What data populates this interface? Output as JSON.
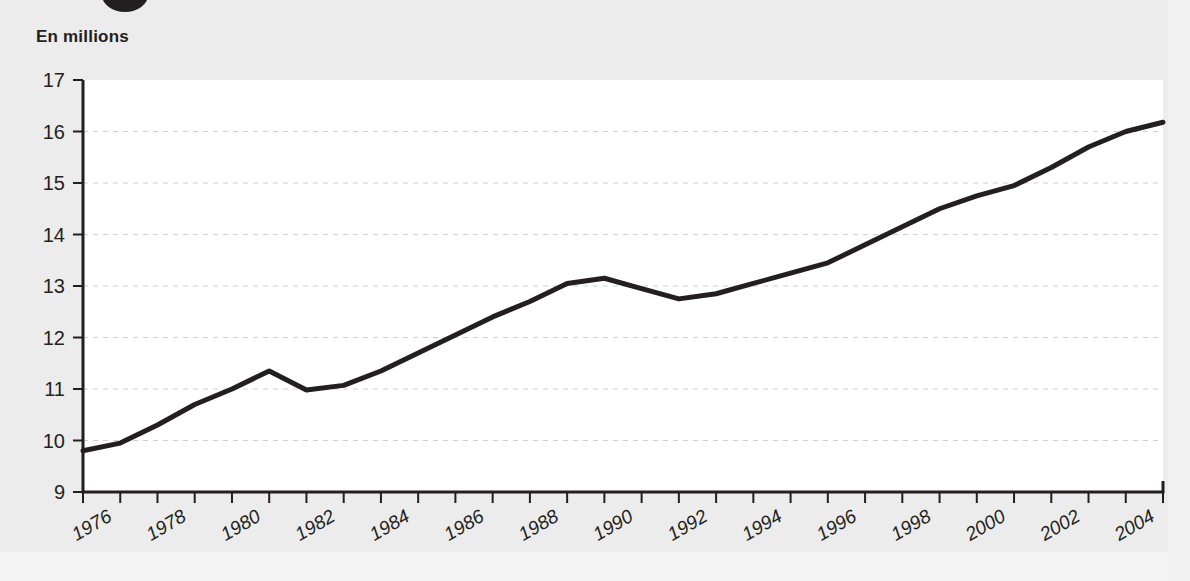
{
  "header": {
    "unit_label": "En millions",
    "marker_icon": "filled-circle-icon"
  },
  "colors": {
    "line": "#231f20",
    "text": "#231f20",
    "grid": "#cfcfcf",
    "plot_background": "#ffffff",
    "page_background": "#ececec"
  },
  "chart_data": {
    "type": "line",
    "title": "",
    "subtitle": "",
    "xlabel": "",
    "ylabel": "En millions",
    "ylim": [
      9,
      17
    ],
    "xlim": [
      1976,
      2005
    ],
    "ytick_labels": [
      "17",
      "16",
      "15",
      "14",
      "13",
      "12",
      "11",
      "10",
      "9"
    ],
    "ytick_values": [
      17,
      16,
      15,
      14,
      13,
      12,
      11,
      10,
      9
    ],
    "xtick_labels": [
      "1976",
      "1978",
      "1980",
      "1982",
      "1984",
      "1986",
      "1988",
      "1990",
      "1992",
      "1994",
      "1996",
      "1998",
      "2000",
      "2002",
      "2004"
    ],
    "xtick_values": [
      1976,
      1978,
      1980,
      1982,
      1984,
      1986,
      1988,
      1990,
      1992,
      1994,
      1996,
      1998,
      2000,
      2002,
      2004
    ],
    "grid": true,
    "grid_axis": "y",
    "legend": null,
    "x": [
      1976,
      1977,
      1978,
      1979,
      1980,
      1981,
      1982,
      1983,
      1984,
      1985,
      1986,
      1987,
      1988,
      1989,
      1990,
      1991,
      1992,
      1993,
      1994,
      1995,
      1996,
      1997,
      1998,
      1999,
      2000,
      2001,
      2002,
      2003,
      2004,
      2005
    ],
    "values": [
      9.8,
      9.95,
      10.3,
      10.7,
      11.0,
      11.35,
      10.98,
      11.07,
      11.35,
      11.7,
      12.05,
      12.4,
      12.7,
      13.05,
      13.15,
      12.95,
      12.75,
      12.85,
      13.05,
      13.25,
      13.45,
      13.8,
      14.15,
      14.5,
      14.75,
      14.95,
      15.3,
      15.7,
      16.0,
      16.18
    ],
    "series": [
      {
        "name": "En millions",
        "values": [
          9.8,
          9.95,
          10.3,
          10.7,
          11.0,
          11.35,
          10.98,
          11.07,
          11.35,
          11.7,
          12.05,
          12.4,
          12.7,
          13.05,
          13.15,
          12.95,
          12.75,
          12.85,
          13.05,
          13.25,
          13.45,
          13.8,
          14.15,
          14.5,
          14.75,
          14.95,
          15.3,
          15.7,
          16.0,
          16.18
        ]
      }
    ]
  }
}
